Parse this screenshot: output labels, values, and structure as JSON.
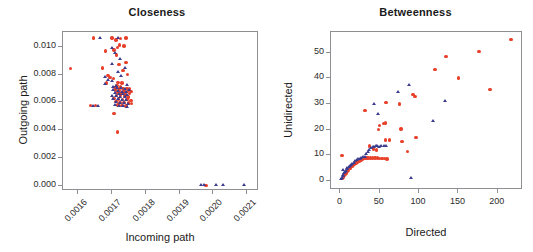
{
  "figure": {
    "background": "#ffffff",
    "marker_colors": {
      "circle_red": "#e8402a",
      "triangle_blue": "#3b3b8f"
    }
  },
  "chart_data": [
    {
      "type": "scatter",
      "title": "Closeness",
      "xlabel": "Incoming path",
      "ylabel": "Outgoing path",
      "xlim": [
        0.001555,
        0.002135
      ],
      "ylim": [
        -0.00035,
        0.01105
      ],
      "xticks": [
        0.0016,
        0.0017,
        0.0018,
        0.0019,
        0.002,
        0.0021
      ],
      "xtick_labels": [
        "0.0016",
        "0.0017",
        "0.0018",
        "0.0019",
        "0.0020",
        "0.0021"
      ],
      "xtick_rotation": -45,
      "yticks": [
        0.0,
        0.002,
        0.004,
        0.006,
        0.008,
        0.01
      ],
      "ytick_labels": [
        "0.000",
        "0.002",
        "0.004",
        "0.006",
        "0.008",
        "0.010"
      ],
      "grid": false,
      "legend": "none",
      "series": [
        {
          "name": "red-circles",
          "marker": "circle",
          "color": "#e8402a",
          "points": [
            [
              0.001578,
              0.00845
            ],
            [
              0.001645,
              0.01063
            ],
            [
              0.0017,
              0.01063
            ],
            [
              0.001712,
              0.01048
            ],
            [
              0.001725,
              0.01058
            ],
            [
              0.001742,
              0.01063
            ],
            [
              0.001722,
              0.01012
            ],
            [
              0.001735,
              0.01005
            ],
            [
              0.001716,
              0.00995
            ],
            [
              0.00168,
              0.00968
            ],
            [
              0.001706,
              0.00975
            ],
            [
              0.001714,
              0.0094
            ],
            [
              0.001741,
              0.00888
            ],
            [
              0.001721,
              0.0087
            ],
            [
              0.001672,
              0.00848
            ],
            [
              0.001732,
              0.00828
            ],
            [
              0.001746,
              0.008
            ],
            [
              0.001688,
              0.00792
            ],
            [
              0.001694,
              0.00778
            ],
            [
              0.001704,
              0.0077
            ],
            [
              0.001684,
              0.0074
            ],
            [
              0.001718,
              0.00745
            ],
            [
              0.00173,
              0.00738
            ],
            [
              0.001715,
              0.00722
            ],
            [
              0.001726,
              0.00715
            ],
            [
              0.001709,
              0.00708
            ],
            [
              0.001721,
              0.007
            ],
            [
              0.001733,
              0.00702
            ],
            [
              0.001744,
              0.00698
            ],
            [
              0.001752,
              0.00695
            ],
            [
              0.001711,
              0.00688
            ],
            [
              0.001723,
              0.00684
            ],
            [
              0.001735,
              0.00682
            ],
            [
              0.001746,
              0.0068
            ],
            [
              0.001756,
              0.00678
            ],
            [
              0.001718,
              0.00672
            ],
            [
              0.001729,
              0.00668
            ],
            [
              0.00174,
              0.00665
            ],
            [
              0.001751,
              0.00662
            ],
            [
              0.001713,
              0.0065
            ],
            [
              0.001726,
              0.00648
            ],
            [
              0.001738,
              0.00645
            ],
            [
              0.001748,
              0.0064
            ],
            [
              0.001706,
              0.00628
            ],
            [
              0.001719,
              0.00625
            ],
            [
              0.001731,
              0.00622
            ],
            [
              0.001744,
              0.0062
            ],
            [
              0.001756,
              0.00615
            ],
            [
              0.001712,
              0.00605
            ],
            [
              0.001724,
              0.006
            ],
            [
              0.001736,
              0.00598
            ],
            [
              0.001748,
              0.00595
            ],
            [
              0.001757,
              0.00592
            ],
            [
              0.001718,
              0.00582
            ],
            [
              0.00173,
              0.00578
            ],
            [
              0.001742,
              0.00575
            ],
            [
              0.001637,
              0.00578
            ],
            [
              0.001652,
              0.00578
            ],
            [
              0.001706,
              0.00522
            ],
            [
              0.001717,
              0.00388
            ],
            [
              0.001978,
              5e-05
            ]
          ]
        },
        {
          "name": "blue-triangles",
          "marker": "triangle",
          "color": "#3b3b8f",
          "points": [
            [
              0.001665,
              0.01062
            ],
            [
              0.001718,
              0.0106
            ],
            [
              0.0017,
              0.00992
            ],
            [
              0.001708,
              0.00955
            ],
            [
              0.001724,
              0.00908
            ],
            [
              0.0017,
              0.00878
            ],
            [
              0.001738,
              0.00845
            ],
            [
              0.001718,
              0.0082
            ],
            [
              0.001681,
              0.00785
            ],
            [
              0.001728,
              0.00788
            ],
            [
              0.001688,
              0.00762
            ],
            [
              0.0017,
              0.00755
            ],
            [
              0.00168,
              0.0073
            ],
            [
              0.001746,
              0.00728
            ],
            [
              0.001712,
              0.00718
            ],
            [
              0.001703,
              0.0071
            ],
            [
              0.001716,
              0.00705
            ],
            [
              0.001728,
              0.007
            ],
            [
              0.001739,
              0.00696
            ],
            [
              0.00175,
              0.00692
            ],
            [
              0.001705,
              0.00686
            ],
            [
              0.001717,
              0.00682
            ],
            [
              0.00173,
              0.00678
            ],
            [
              0.001742,
              0.00674
            ],
            [
              0.00171,
              0.00668
            ],
            [
              0.001722,
              0.00664
            ],
            [
              0.001734,
              0.0066
            ],
            [
              0.001746,
              0.00656
            ],
            [
              0.0017,
              0.00648
            ],
            [
              0.001713,
              0.00644
            ],
            [
              0.001725,
              0.0064
            ],
            [
              0.001738,
              0.00636
            ],
            [
              0.001705,
              0.00626
            ],
            [
              0.001718,
              0.00622
            ],
            [
              0.001731,
              0.00618
            ],
            [
              0.001742,
              0.00614
            ],
            [
              0.001711,
              0.00602
            ],
            [
              0.001723,
              0.00598
            ],
            [
              0.001736,
              0.00594
            ],
            [
              0.001748,
              0.0059
            ],
            [
              0.001708,
              0.0058
            ],
            [
              0.00172,
              0.00576
            ],
            [
              0.001733,
              0.00572
            ],
            [
              0.001745,
              0.00568
            ],
            [
              0.001643,
              0.00578
            ],
            [
              0.001658,
              0.00578
            ],
            [
              0.001965,
              5e-05
            ],
            [
              0.001972,
              5e-05
            ],
            [
              0.002008,
              5e-05
            ],
            [
              0.00203,
              5e-05
            ],
            [
              0.002092,
              5e-05
            ]
          ]
        }
      ]
    },
    {
      "type": "scatter",
      "title": "Betweenness",
      "xlabel": "Directed",
      "ylabel": "Unidirected",
      "xlim": [
        -12,
        232
      ],
      "ylim": [
        -3.5,
        58
      ],
      "xticks": [
        0,
        50,
        100,
        150,
        200
      ],
      "xtick_labels": [
        "0",
        "50",
        "100",
        "150",
        "200"
      ],
      "xtick_rotation": 0,
      "yticks": [
        0,
        10,
        20,
        30,
        40,
        50
      ],
      "ytick_labels": [
        "0",
        "10",
        "20",
        "30",
        "40",
        "50"
      ],
      "grid": false,
      "legend": "none",
      "series": [
        {
          "name": "red-circles",
          "marker": "circle",
          "color": "#e8402a",
          "points": [
            [
              2,
              10.0
            ],
            [
              3,
              1.0
            ],
            [
              4,
              1.6
            ],
            [
              5,
              2.2
            ],
            [
              6,
              2.6
            ],
            [
              7,
              3.0
            ],
            [
              8,
              3.4
            ],
            [
              9,
              3.8
            ],
            [
              10,
              4.2
            ],
            [
              12,
              4.8
            ],
            [
              13,
              5.4
            ],
            [
              15,
              5.8
            ],
            [
              16,
              6.2
            ],
            [
              18,
              6.6
            ],
            [
              20,
              7.0
            ],
            [
              22,
              7.4
            ],
            [
              24,
              7.8
            ],
            [
              26,
              8.2
            ],
            [
              28,
              8.6
            ],
            [
              30,
              8.8
            ],
            [
              32,
              9.0
            ],
            [
              34,
              9.0
            ],
            [
              36,
              9.0
            ],
            [
              38,
              9.0
            ],
            [
              41,
              9.0
            ],
            [
              44,
              9.0
            ],
            [
              47,
              9.0
            ],
            [
              50,
              8.8
            ],
            [
              53,
              8.8
            ],
            [
              56,
              8.8
            ],
            [
              59,
              8.6
            ],
            [
              31,
              27.4
            ],
            [
              37,
              13.6
            ],
            [
              42,
              12.5
            ],
            [
              46,
              12.0
            ],
            [
              48,
              20.0
            ],
            [
              50,
              21.5
            ],
            [
              55,
              22.3
            ],
            [
              57,
              22.6
            ],
            [
              58,
              30.6
            ],
            [
              57,
              16.0
            ],
            [
              62,
              16.0
            ],
            [
              75,
              30.0
            ],
            [
              77,
              20.3
            ],
            [
              78,
              15.4
            ],
            [
              85,
              11.4
            ],
            [
              92,
              33.6
            ],
            [
              95,
              33.0
            ],
            [
              96,
              17.0
            ],
            [
              120,
              43.3
            ],
            [
              134,
              48.4
            ],
            [
              150,
              40.1
            ],
            [
              176,
              50.3
            ],
            [
              190,
              35.5
            ],
            [
              217,
              55.0
            ]
          ]
        },
        {
          "name": "blue-triangles",
          "marker": "triangle",
          "color": "#3b3b8f",
          "points": [
            [
              1,
              0.6
            ],
            [
              2,
              1.2
            ],
            [
              3,
              1.8
            ],
            [
              3,
              4.2
            ],
            [
              4,
              2.4
            ],
            [
              5,
              3.0
            ],
            [
              6,
              3.6
            ],
            [
              7,
              4.0
            ],
            [
              8,
              4.6
            ],
            [
              9,
              5.0
            ],
            [
              11,
              5.6
            ],
            [
              12,
              6.0
            ],
            [
              14,
              6.4
            ],
            [
              15,
              6.8
            ],
            [
              17,
              7.2
            ],
            [
              19,
              7.6
            ],
            [
              21,
              8.0
            ],
            [
              23,
              8.4
            ],
            [
              25,
              8.7
            ],
            [
              27,
              9.0
            ],
            [
              29,
              9.2
            ],
            [
              31,
              9.4
            ],
            [
              33,
              10.4
            ],
            [
              35,
              11.2
            ],
            [
              37,
              12.0
            ],
            [
              39,
              12.8
            ],
            [
              41,
              13.2
            ],
            [
              43,
              13.4
            ],
            [
              45,
              13.5
            ],
            [
              47,
              13.6
            ],
            [
              49,
              13.4
            ],
            [
              52,
              13.6
            ],
            [
              55,
              13.8
            ],
            [
              58,
              13.6
            ],
            [
              43,
              30.0
            ],
            [
              48,
              26.2
            ],
            [
              73,
              34.5
            ],
            [
              88,
              37.2
            ],
            [
              90,
              1.2
            ],
            [
              118,
              23.4
            ],
            [
              133,
              31.0
            ]
          ]
        }
      ]
    }
  ]
}
